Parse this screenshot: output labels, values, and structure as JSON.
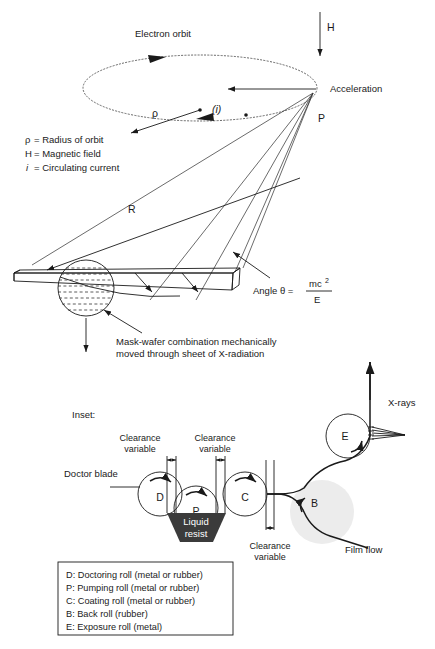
{
  "figure": {
    "title_top": "Electron orbit",
    "upper": {
      "orbit_label": "Electron orbit",
      "magnetic_field_symbol": "H",
      "acceleration_label": "Acceleration",
      "point_label": "P",
      "radius_symbol": "ρ",
      "current_symbol": "(i)",
      "distance_symbol": "R",
      "angle_text": "Angle  θ  =",
      "angle_numerator": "mc",
      "angle_numerator_exp": "2",
      "angle_denominator": "E",
      "mask_note_line1": "Mask-wafer combination mechanically",
      "mask_note_line2": "moved through sheet of X-radiation"
    },
    "key": [
      {
        "symbol": "ρ",
        "italic": false,
        "text": "= Radius of orbit"
      },
      {
        "symbol": "H",
        "italic": false,
        "text": "= Magnetic field"
      },
      {
        "symbol": "i",
        "italic": true,
        "text": "= Circulating current"
      }
    ],
    "inset": {
      "caption": "Inset:",
      "doctor_blade_label": "Doctor blade",
      "liquid_resist_line1": "Liquid",
      "liquid_resist_line2": "resist",
      "xrays_label": "X-rays",
      "film_flow_label": "Film flow",
      "clearance_labels": [
        {
          "line1": "Clearance",
          "line2": "variable"
        },
        {
          "line1": "Clearance",
          "line2": "variable"
        },
        {
          "line1": "Clearance",
          "line2": "variable"
        }
      ],
      "rolls": [
        {
          "id": "D"
        },
        {
          "id": "P"
        },
        {
          "id": "C"
        },
        {
          "id": "B"
        },
        {
          "id": "E"
        }
      ]
    },
    "legend_box": [
      "D: Doctoring roll (metal or rubber)",
      "P: Pumping roll (metal or rubber)",
      "C: Coating roll (metal or rubber)",
      "B: Back roll (rubber)",
      "E: Exposure roll (metal)"
    ],
    "colors": {
      "ink": "#1a1a1a",
      "orbit_stroke": "#555555",
      "resist_fill": "#3b3b3b",
      "back_roll_fill": "#ececec",
      "paper": "#ffffff"
    }
  }
}
